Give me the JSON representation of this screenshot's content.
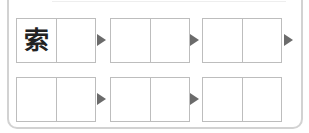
{
  "worksheet": {
    "rows": [
      {
        "groups": [
          {
            "cells": [
              "索",
              ""
            ]
          },
          {
            "cells": [
              "",
              ""
            ]
          },
          {
            "cells": [
              "",
              ""
            ]
          }
        ]
      },
      {
        "groups": [
          {
            "cells": [
              "",
              ""
            ]
          },
          {
            "cells": [
              "",
              ""
            ]
          },
          {
            "cells": [
              "",
              ""
            ]
          }
        ]
      }
    ],
    "arrow_color": "#6b6b6b",
    "border_color": "#bdbdbd"
  }
}
